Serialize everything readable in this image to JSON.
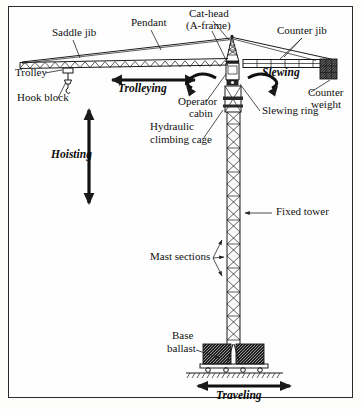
{
  "figure": {
    "kind": "technical-diagram",
    "background_color": "#fefefe",
    "line_color": "#1a1a1a",
    "border_color": "#2a2a2a"
  },
  "part_labels": [
    {
      "id": "saddle-jib",
      "text": "Saddle jib",
      "x": 52,
      "y": 36
    },
    {
      "id": "pendant",
      "text": "Pendant",
      "x": 131,
      "y": 26
    },
    {
      "id": "cat-head-line1",
      "text": "Cat-head",
      "x": 189,
      "y": 17
    },
    {
      "id": "cat-head-line2",
      "text": "(A-frame)",
      "x": 186,
      "y": 29
    },
    {
      "id": "counter-jib",
      "text": "Counter jib",
      "x": 277,
      "y": 34
    },
    {
      "id": "trolley",
      "text": "Trolley",
      "x": 15,
      "y": 76
    },
    {
      "id": "hook-block",
      "text": "Hook block",
      "x": 17,
      "y": 101
    },
    {
      "id": "operator-line1",
      "text": "Operator",
      "x": 178,
      "y": 105
    },
    {
      "id": "operator-line2",
      "text": "cabin",
      "x": 189,
      "y": 117
    },
    {
      "id": "slewing-ring",
      "text": "Slewing ring",
      "x": 262,
      "y": 114
    },
    {
      "id": "counter-wt-line1",
      "text": "Counter",
      "x": 308,
      "y": 96
    },
    {
      "id": "counter-wt-line2",
      "text": "weight",
      "x": 311,
      "y": 108
    },
    {
      "id": "hydraulic-line1",
      "text": "Hydraulic",
      "x": 150,
      "y": 130
    },
    {
      "id": "hydraulic-line2",
      "text": "climbing cage",
      "x": 150,
      "y": 143
    },
    {
      "id": "fixed-tower",
      "text": "Fixed tower",
      "x": 276,
      "y": 215
    },
    {
      "id": "mast-sections",
      "text": "Mast sections",
      "x": 150,
      "y": 260
    },
    {
      "id": "base-line1",
      "text": "Base",
      "x": 172,
      "y": 339
    },
    {
      "id": "base-line2",
      "text": "ballast",
      "x": 167,
      "y": 352
    }
  ],
  "motion_labels": [
    {
      "id": "trolleying",
      "text": "Trolleying",
      "x": 137,
      "y": 89
    },
    {
      "id": "slewing",
      "text": "Slewing",
      "x": 277,
      "y": 78
    },
    {
      "id": "hoisting",
      "text": "Hoisting",
      "x": 91,
      "y": 155
    },
    {
      "id": "traveling",
      "text": "Traveling",
      "x": 245,
      "y": 398
    }
  ],
  "motion_arrows": [
    {
      "id": "trolleying-arrow",
      "type": "double-horizontal",
      "description": "horizontal double-headed arrow under the saddle jib"
    },
    {
      "id": "hoisting-arrow",
      "type": "double-vertical",
      "description": "vertical double-headed arrow below the hook block"
    },
    {
      "id": "slewing-arrows",
      "type": "curved-rotation",
      "description": "two curved rotation arrows either side of the mast top"
    },
    {
      "id": "traveling-arrow",
      "type": "double-horizontal",
      "description": "horizontal double-headed arrow below the ground line"
    }
  ],
  "components": [
    {
      "id": "saddle-jib-truss",
      "name": "Saddle jib lattice truss"
    },
    {
      "id": "pendant-cables",
      "name": "Pendant tie cables"
    },
    {
      "id": "cat-head-frame",
      "name": "Cat-head A-frame lattice"
    },
    {
      "id": "counter-jib-beam",
      "name": "Counter jib box beam"
    },
    {
      "id": "counter-weight-blk",
      "name": "Counter weight block"
    },
    {
      "id": "trolley-unit",
      "name": "Trolley"
    },
    {
      "id": "hook-block-unit",
      "name": "Hook block"
    },
    {
      "id": "operator-cabin-box",
      "name": "Operator cabin"
    },
    {
      "id": "slewing-ring-unit",
      "name": "Slewing ring"
    },
    {
      "id": "climbing-cage-unit",
      "name": "Hydraulic climbing cage"
    },
    {
      "id": "mast-lattice",
      "name": "Fixed tower mast lattice"
    },
    {
      "id": "base-ballast-blk",
      "name": "Base ballast"
    },
    {
      "id": "ground-hatch",
      "name": "Ground line hatching"
    }
  ]
}
